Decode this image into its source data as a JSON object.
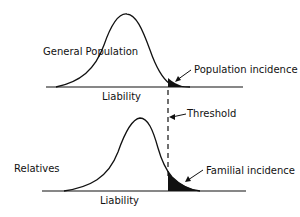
{
  "diagram": {
    "type": "liability-threshold-model",
    "colors": {
      "ink": "#111111",
      "background": "#ffffff"
    },
    "top_panel": {
      "group_label": "General Population",
      "axis_label": "Liability",
      "tail_label": "Population incidence"
    },
    "bottom_panel": {
      "group_label": "Relatives",
      "axis_label": "Liability",
      "tail_label": "Familial incidence"
    },
    "threshold_label": "Threshold"
  }
}
